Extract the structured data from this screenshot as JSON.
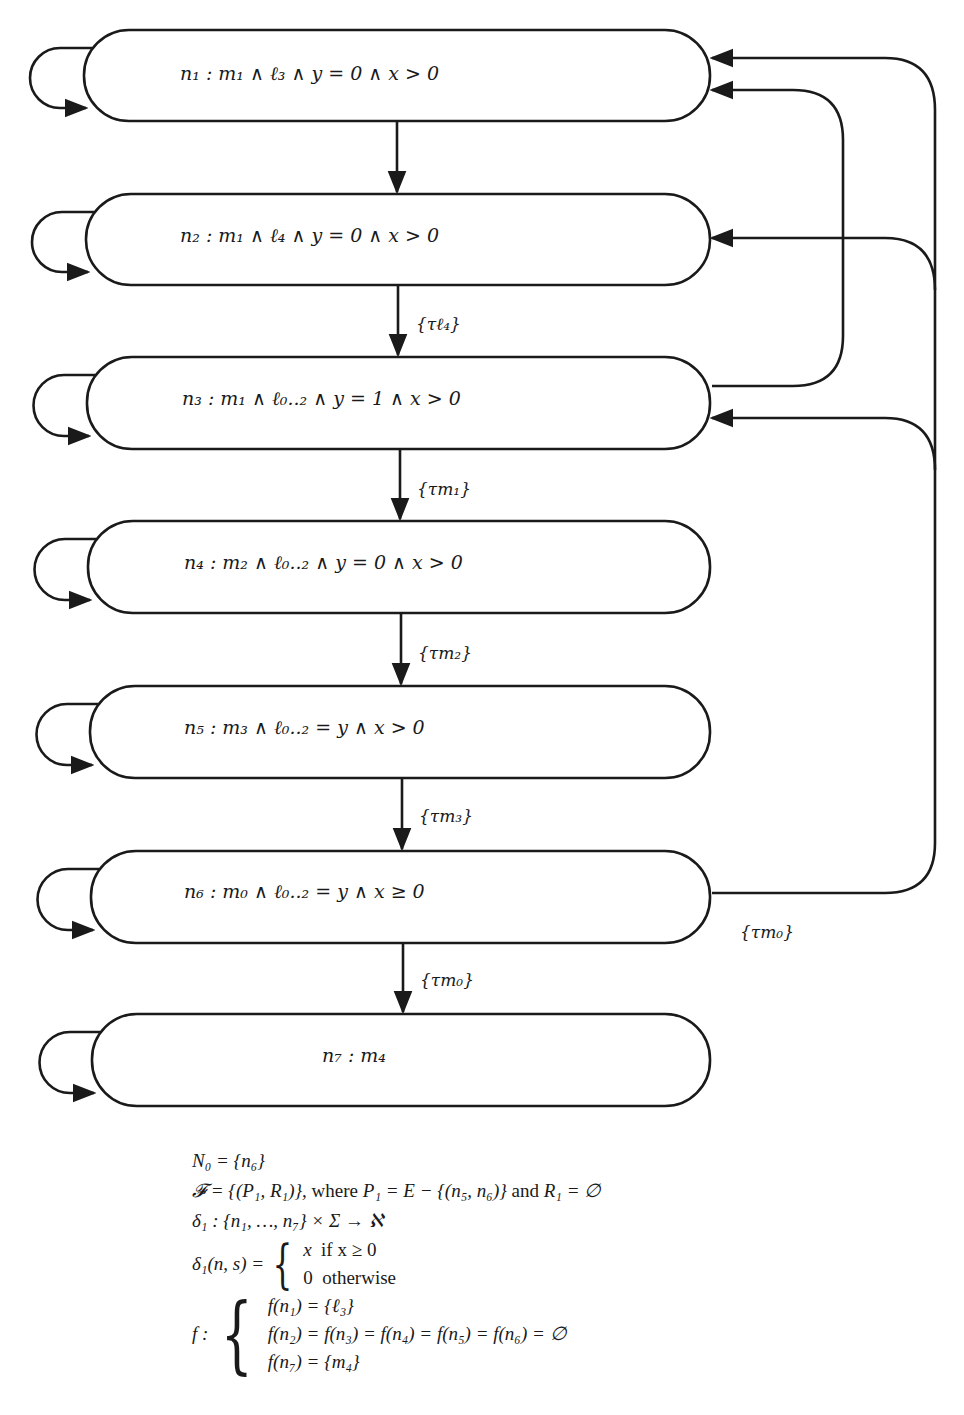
{
  "diagram": {
    "stroke_color": "#1a1a1a",
    "background": "#ffffff",
    "nodes": [
      {
        "id": "n1",
        "label": "n₁ :  m₁ ∧ ℓ₃ ∧ y = 0 ∧ x > 0",
        "self_loop": true
      },
      {
        "id": "n2",
        "label": "n₂ :  m₁ ∧ ℓ₄ ∧ y = 0 ∧ x > 0",
        "self_loop": true
      },
      {
        "id": "n3",
        "label": "n₃ :  m₁ ∧ ℓ₀..₂ ∧ y = 1 ∧ x > 0",
        "self_loop": true
      },
      {
        "id": "n4",
        "label": "n₄ :  m₂ ∧ ℓ₀..₂ ∧ y = 0 ∧ x > 0",
        "self_loop": true
      },
      {
        "id": "n5",
        "label": "n₅ :  m₃ ∧ ℓ₀..₂ = y ∧ x > 0",
        "self_loop": true
      },
      {
        "id": "n6",
        "label": "n₆ :  m₀ ∧ ℓ₀..₂ = y ∧ x ≥ 0",
        "self_loop": true
      },
      {
        "id": "n7",
        "label": "n₇ :  m₄",
        "self_loop": true
      }
    ],
    "edges": [
      {
        "from": "n1",
        "to": "n2",
        "label": ""
      },
      {
        "from": "n2",
        "to": "n3",
        "label": "{τℓ₄}"
      },
      {
        "from": "n3",
        "to": "n4",
        "label": "{τm₁}"
      },
      {
        "from": "n4",
        "to": "n5",
        "label": "{τm₂}"
      },
      {
        "from": "n5",
        "to": "n6",
        "label": "{τm₃}"
      },
      {
        "from": "n6",
        "to": "n7",
        "label": "{τm₀}"
      },
      {
        "from": "n3",
        "to": "n1",
        "label": ""
      },
      {
        "from": "n6",
        "to": "n1",
        "label": "{τm₀}"
      },
      {
        "from": "n6",
        "to": "n2",
        "label": "{τm₀}"
      },
      {
        "from": "n6",
        "to": "n3",
        "label": "{τm₀}"
      }
    ],
    "edge_labels": {
      "n2_n3": "{τℓ₄}",
      "n3_n4": "{τm₁}",
      "n4_n5": "{τm₂}",
      "n5_n6": "{τm₃}",
      "n6_n7": "{τm₀}",
      "n6_back": "{τm₀}"
    }
  },
  "definitions": {
    "initial": "N₀ = {n₆}",
    "fairness_prefix": "𝓕 = {(P₁, R₁)}, ",
    "fairness_where": "where",
    "fairness_p": " P₁ = E − {(n₅, n₆)} ",
    "fairness_and": "and",
    "fairness_r": " R₁ = ∅",
    "delta_sig": "δ₁ : {n₁, …, n₇} × Σ → ℵ",
    "delta_lhs": "δ₁(n, s) =",
    "delta_cases": [
      {
        "value": "x",
        "cond": "if x ≥ 0"
      },
      {
        "value": "0",
        "cond": "otherwise"
      }
    ],
    "f_lhs": "f :",
    "f_cases": [
      "f(n₁) = {ℓ₃}",
      "f(n₂) = f(n₃) = f(n₄) = f(n₅) = f(n₆) = ∅",
      "f(n₇) = {m₄}"
    ]
  }
}
